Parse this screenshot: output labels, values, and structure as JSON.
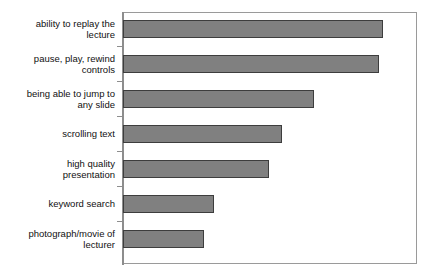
{
  "chart_data": {
    "type": "bar",
    "orientation": "horizontal",
    "title": "",
    "subtitle": "",
    "xlabel": "",
    "ylabel": "",
    "categories": [
      "ability to replay the\nlecture",
      "pause, play, rewind\ncontrols",
      "being able to jump to\nany slide",
      "scrolling text",
      "high quality\npresentation",
      "keyword search",
      "photograph/movie of\nlecturer"
    ],
    "values": [
      100,
      98.5,
      73.5,
      61,
      56,
      35,
      31
    ],
    "xlim": [
      0,
      113
    ],
    "ylim": null,
    "tick_labels": [],
    "grid": false,
    "legend": null,
    "annotations": [],
    "bar_color": "#808080",
    "bar_border_color": "#3d3d3d",
    "frame_color": "#8d8d8d",
    "background_color": "#ffffff",
    "label_color": "#111111"
  }
}
